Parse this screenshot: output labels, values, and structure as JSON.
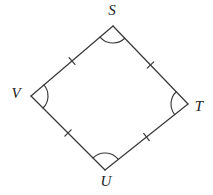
{
  "figure": {
    "name": "quadrilateral-svut",
    "background_color": "#ffffff",
    "stroke_color": "#3a3a3c",
    "label_color": "#1b1b1d",
    "width": 213,
    "height": 195,
    "vertices": [
      {
        "id": "S",
        "label": "S",
        "x": 113,
        "y": 26,
        "label_x": 112,
        "label_y": 12,
        "arc_radius": 17,
        "arc_marks": 1
      },
      {
        "id": "T",
        "label": "T",
        "x": 188,
        "y": 104,
        "label_x": 199,
        "label_y": 108,
        "arc_radius": 17,
        "arc_marks": 1
      },
      {
        "id": "U",
        "label": "U",
        "x": 105,
        "y": 170,
        "label_x": 106,
        "label_y": 183,
        "arc_radius": 17,
        "arc_marks": 1
      },
      {
        "id": "V",
        "label": "V",
        "x": 31,
        "y": 96,
        "label_x": 16,
        "label_y": 95,
        "arc_radius": 17,
        "arc_marks": 1
      }
    ],
    "sides": [
      {
        "id": "VS",
        "from": "V",
        "to": "S",
        "ticks": 1
      },
      {
        "id": "ST",
        "from": "S",
        "to": "T",
        "ticks": 1
      },
      {
        "id": "TU",
        "from": "T",
        "to": "U",
        "ticks": 1
      },
      {
        "id": "UV",
        "from": "U",
        "to": "V",
        "ticks": 1
      }
    ],
    "tick_length": 9,
    "congruence_note": "all four sides marked with a single tick (congruent)"
  }
}
